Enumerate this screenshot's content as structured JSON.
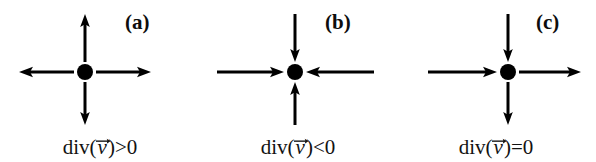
{
  "figure": {
    "background_color": "#ffffff",
    "ink_color": "#000000",
    "width": 596,
    "height": 162
  },
  "panels": [
    {
      "id": "panel-a",
      "tag": "(a)",
      "caption_prefix": "div(",
      "caption_vector": "v",
      "caption_suffix": ")>0",
      "caption_full": "div(v⃗)>0",
      "meaning": "divergence positive — source, all arrows point outward",
      "center_x": 85,
      "center_y": 72,
      "dot_radius": 8,
      "arrows": {
        "up": "outward",
        "down": "outward",
        "left": "outward",
        "right": "outward"
      }
    },
    {
      "id": "panel-b",
      "tag": "(b)",
      "caption_prefix": "div(",
      "caption_vector": "v",
      "caption_suffix": ")<0",
      "caption_full": "div(v⃗)<0",
      "meaning": "divergence negative — sink, all arrows point inward",
      "center_x": 97,
      "center_y": 72,
      "dot_radius": 8,
      "arrows": {
        "up": "inward",
        "down": "inward",
        "left": "inward",
        "right": "inward"
      }
    },
    {
      "id": "panel-c",
      "tag": "(c)",
      "caption_prefix": "div(",
      "caption_vector": "v",
      "caption_suffix": ")=0",
      "caption_full": "div(v⃗)=0",
      "meaning": "divergence zero — uniform flow, inflow equals outflow",
      "center_x": 112,
      "center_y": 72,
      "dot_radius": 8,
      "arrows": {
        "up": "inward",
        "down": "outward",
        "left": "inward",
        "right": "outward"
      }
    }
  ]
}
